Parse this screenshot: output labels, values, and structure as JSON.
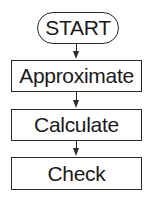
{
  "diagram": {
    "type": "flowchart",
    "direction": "top-to-bottom",
    "nodes": [
      {
        "id": "start",
        "label": "START",
        "shape": "terminator"
      },
      {
        "id": "approximate",
        "label": "Approximate",
        "shape": "process"
      },
      {
        "id": "calculate",
        "label": "Calculate",
        "shape": "process"
      },
      {
        "id": "check",
        "label": "Check",
        "shape": "process"
      }
    ],
    "edges": [
      {
        "from": "start",
        "to": "approximate"
      },
      {
        "from": "approximate",
        "to": "calculate"
      },
      {
        "from": "calculate",
        "to": "check"
      }
    ]
  },
  "colors": {
    "stroke": "#2a2a2a",
    "text": "#1a1a1a",
    "background": "#ffffff"
  }
}
